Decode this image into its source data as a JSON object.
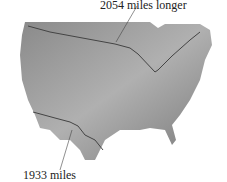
{
  "map": {
    "labels": {
      "north_border": "2054 miles longer",
      "south_border": "1933 miles"
    },
    "colors": {
      "land": "#9a9a9a",
      "border": "#444444",
      "background": "#ffffff"
    }
  }
}
